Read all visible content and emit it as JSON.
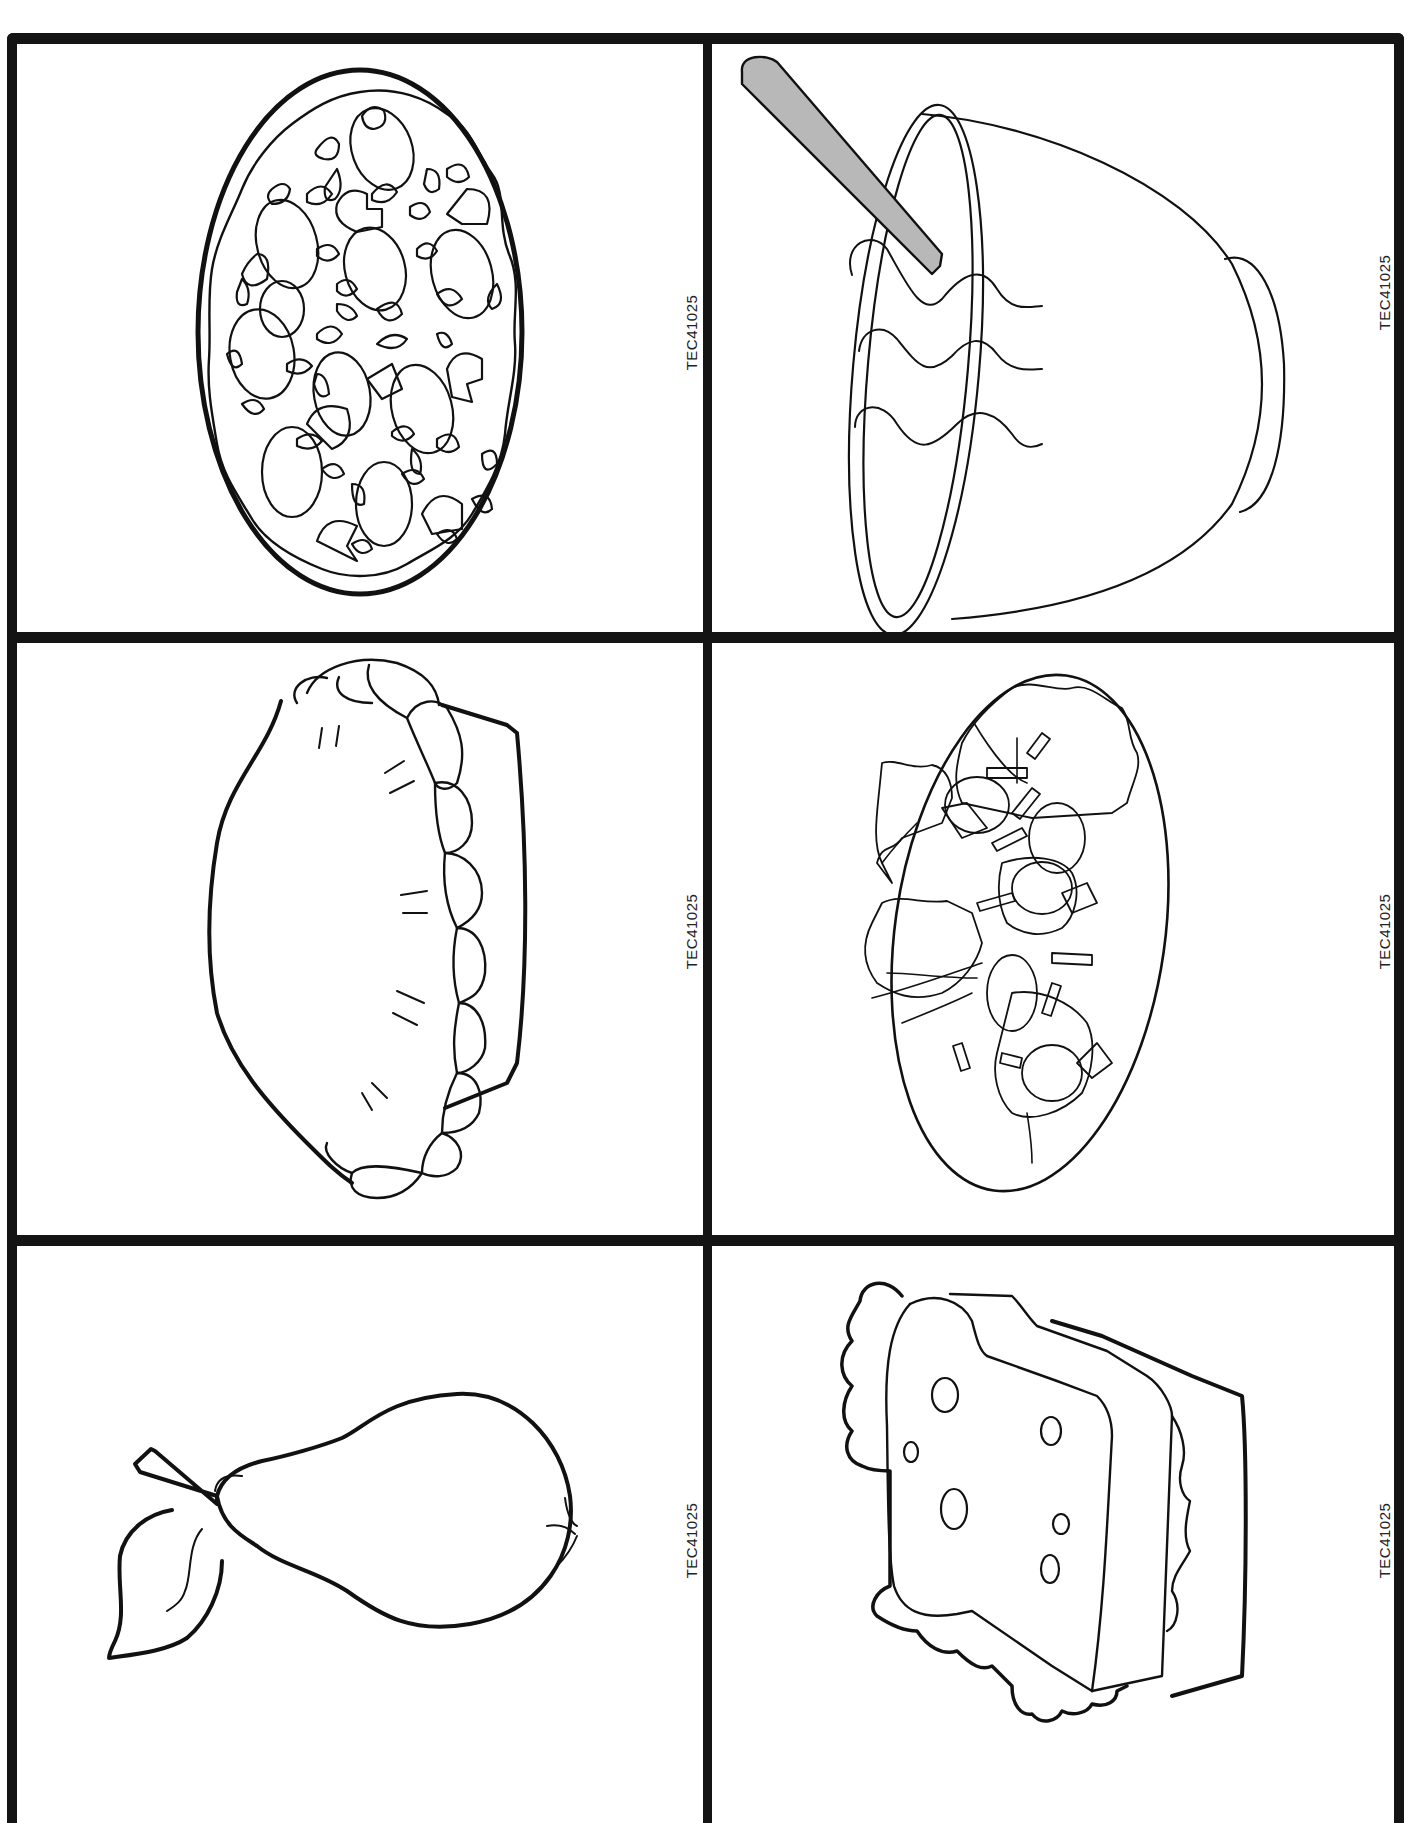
{
  "page": {
    "header_text": "page",
    "background": "#ffffff",
    "line_color": "#141414"
  },
  "grid": {
    "rows": 3,
    "columns": 2,
    "bottom_edge": "cut off"
  },
  "cards": [
    {
      "position": "row-1-col-1",
      "illustration": "pizza-icon",
      "label": "TEC41025"
    },
    {
      "position": "row-1-col-2",
      "illustration": "soup-bowl-icon",
      "label": "TEC41025"
    },
    {
      "position": "row-2-col-1",
      "illustration": "pie-icon",
      "label": "TEC41025"
    },
    {
      "position": "row-2-col-2",
      "illustration": "salad-icon",
      "label": "TEC41025"
    },
    {
      "position": "row-3-col-1",
      "illustration": "pear-icon",
      "label": "TEC41025"
    },
    {
      "position": "row-3-col-2",
      "illustration": "sandwich-icon",
      "label": "TEC41025"
    }
  ],
  "colors": {
    "spoon_fill": "#b8b8b8",
    "outline": "#111111"
  }
}
